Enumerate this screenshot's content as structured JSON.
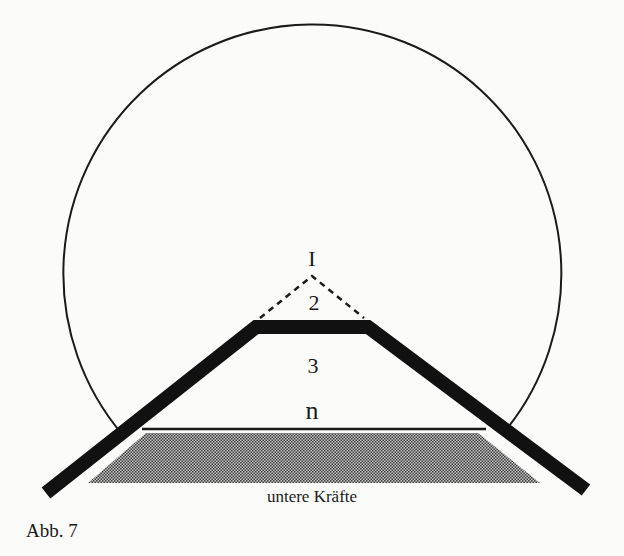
{
  "figure": {
    "caption": "Abb. 7",
    "labels": {
      "level_1": "I",
      "level_2": "2",
      "level_3": "3",
      "level_n": "n",
      "lower_forces": "untere Kräfte"
    },
    "colors": {
      "ink": "#1a1a1a",
      "hatch": "#6e6e6e",
      "paper": "#fbfbf9"
    }
  }
}
